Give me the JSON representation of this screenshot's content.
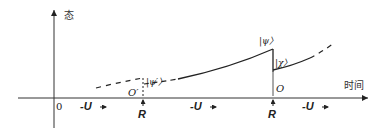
{
  "diagram": {
    "y_axis_label": "态",
    "x_axis_label": "时间",
    "origin_label": "0",
    "evolution_labels": [
      "-U",
      "-U",
      "-U"
    ],
    "measurement_labels": [
      "R",
      "R"
    ],
    "state_labels": {
      "psi_prime": "|ψ′〉",
      "psi": "|ψ〉",
      "chi": "|χ〉"
    },
    "point_labels": {
      "o_prime": "O′",
      "o": "O"
    },
    "colors": {
      "line": "#222222",
      "text": "#222222"
    }
  }
}
